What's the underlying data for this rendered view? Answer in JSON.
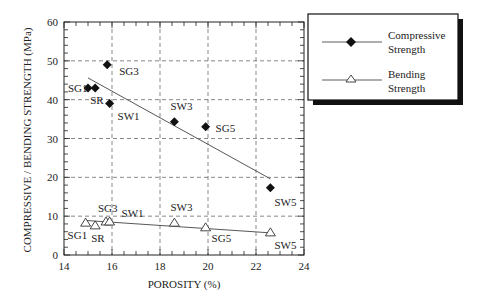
{
  "chart_data": {
    "type": "scatter",
    "title": "",
    "xlabel": "POROSITY (%)",
    "ylabel": "COMPRESSIVE / BENDING STRENGTH (MPa)",
    "xlim": [
      14,
      24
    ],
    "ylim": [
      0,
      60
    ],
    "xticks": [
      14,
      16,
      18,
      20,
      22,
      24
    ],
    "yticks": [
      0,
      10,
      20,
      30,
      40,
      50,
      60
    ],
    "grid": true,
    "legend_position": "upper right, outside plot",
    "series": [
      {
        "name": "Compressive Strength",
        "marker": "filled-diamond",
        "points": [
          {
            "label": "SG1",
            "x": 15.0,
            "y": 43.0
          },
          {
            "label": "SR",
            "x": 15.3,
            "y": 43.0
          },
          {
            "label": "SG3",
            "x": 15.8,
            "y": 49.0
          },
          {
            "label": "SW1",
            "x": 15.9,
            "y": 39.0
          },
          {
            "label": "SW3",
            "x": 18.6,
            "y": 34.3
          },
          {
            "label": "SG5",
            "x": 19.9,
            "y": 33.0
          },
          {
            "label": "SW5",
            "x": 22.6,
            "y": 17.3
          }
        ],
        "trendline": {
          "x": [
            15.0,
            22.6
          ],
          "y": [
            45.6,
            19.6
          ]
        }
      },
      {
        "name": "Bending Strength",
        "marker": "open-triangle",
        "points": [
          {
            "label": "SG1",
            "x": 14.9,
            "y": 8.2
          },
          {
            "label": "SR",
            "x": 15.3,
            "y": 7.5
          },
          {
            "label": "SG3",
            "x": 15.75,
            "y": 8.5
          },
          {
            "label": "SW1",
            "x": 15.9,
            "y": 8.5
          },
          {
            "label": "SW3",
            "x": 18.6,
            "y": 8.2
          },
          {
            "label": "SG5",
            "x": 19.9,
            "y": 7.0
          },
          {
            "label": "SW5",
            "x": 22.6,
            "y": 5.7
          }
        ],
        "trendline": {
          "x": [
            14.9,
            22.6
          ],
          "y": [
            8.9,
            5.7
          ]
        }
      }
    ]
  },
  "legend": {
    "items": [
      {
        "line1": "Compressive",
        "line2": "Strength"
      },
      {
        "line1": "Bending",
        "line2": "Strength"
      }
    ]
  },
  "axes": {
    "xlabel": "POROSITY (%)",
    "ylabel": "COMPRESSIVE / BENDING STRENGTH (MPa)"
  }
}
